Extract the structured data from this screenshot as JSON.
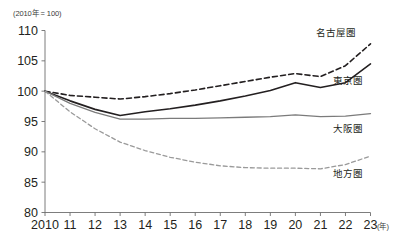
{
  "chart_data": {
    "type": "line",
    "title": "",
    "unit_note": "(2010年 = 100)",
    "xlabel": "",
    "xaxis_unit": "(年)",
    "ylabel": "",
    "ylim": [
      80,
      110
    ],
    "yticks": [
      80,
      85,
      90,
      95,
      100,
      105,
      110
    ],
    "ytick_labels": [
      "80",
      "85",
      "90",
      "95",
      "100",
      "105",
      "110"
    ],
    "x": [
      2010,
      2011,
      2012,
      2013,
      2014,
      2015,
      2016,
      2017,
      2018,
      2019,
      2020,
      2021,
      2022,
      2023
    ],
    "xtick_labels": [
      "2010",
      "11",
      "12",
      "13",
      "14",
      "15",
      "16",
      "17",
      "18",
      "19",
      "20",
      "21",
      "22",
      "23"
    ],
    "grid": false,
    "legend": "inline-right-labels",
    "series": [
      {
        "name": "名古屋圏",
        "label": "名古屋圏",
        "color": "#231f20",
        "style": "dashed",
        "width": 1.6,
        "values": [
          100.0,
          99.3,
          99.0,
          98.7,
          99.1,
          99.6,
          100.2,
          100.9,
          101.6,
          102.3,
          102.9,
          102.4,
          104.2,
          107.8
        ]
      },
      {
        "name": "東京圏",
        "label": "東京圏",
        "color": "#231f20",
        "style": "solid",
        "width": 1.6,
        "values": [
          100.0,
          98.4,
          97.0,
          96.0,
          96.6,
          97.1,
          97.7,
          98.4,
          99.2,
          100.1,
          101.4,
          100.6,
          101.4,
          104.5
        ]
      },
      {
        "name": "大阪圏",
        "label": "大阪圏",
        "color": "#7b7b7b",
        "style": "solid",
        "width": 1.3,
        "values": [
          100.0,
          98.0,
          96.5,
          95.4,
          95.4,
          95.5,
          95.5,
          95.6,
          95.7,
          95.8,
          96.1,
          95.8,
          95.9,
          96.3
        ]
      },
      {
        "name": "地方圏",
        "label": "地方圏",
        "color": "#9a9a9a",
        "style": "dashed",
        "width": 1.3,
        "values": [
          100.0,
          96.6,
          93.8,
          91.6,
          90.2,
          89.1,
          88.3,
          87.7,
          87.4,
          87.3,
          87.3,
          87.2,
          87.9,
          89.3
        ]
      }
    ],
    "series_label_positions": [
      {
        "label": "名古屋圏",
        "x": 336,
        "y": 36
      },
      {
        "label": "東京圏",
        "x": 348,
        "y": 84
      },
      {
        "label": "大阪圏",
        "x": 348,
        "y": 132
      },
      {
        "label": "地方圏",
        "x": 348,
        "y": 177
      }
    ]
  }
}
